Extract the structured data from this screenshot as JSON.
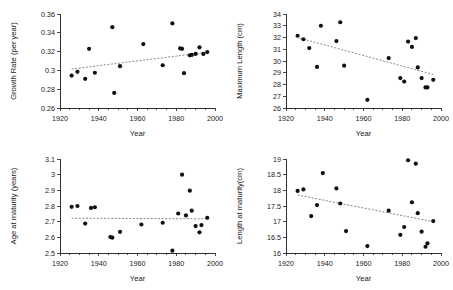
{
  "figure": {
    "title": "",
    "layout": "2x2 grid of scatter plots with dotted linear trend lines",
    "panel_count": 4
  },
  "chart_data": [
    {
      "id": "growth-rate",
      "type": "scatter",
      "title": "",
      "xlabel": "Year",
      "ylabel": "Growth Rate (per year)",
      "xlim": [
        1920,
        2000
      ],
      "ylim": [
        0.26,
        0.36
      ],
      "xticks": [
        1920,
        1940,
        1960,
        1980,
        2000
      ],
      "xtick_labels": [
        "1920",
        "1940",
        "1960",
        "1980",
        "2000"
      ],
      "yticks": [
        0.26,
        0.28,
        0.3,
        0.32,
        0.34,
        0.36
      ],
      "ytick_labels": [
        "0.26",
        "0.28",
        "0.3",
        "0.32",
        "0.34",
        "0.36"
      ],
      "minor_tick_step": 5,
      "grid": false,
      "legend": "none",
      "trend": {
        "style": "dotted",
        "x": [
          1926,
          1997
        ],
        "y": [
          0.3015,
          0.3195
        ],
        "slope_sign": "positive"
      },
      "points": [
        {
          "x": 1926,
          "y": 0.2945
        },
        {
          "x": 1929,
          "y": 0.2985
        },
        {
          "x": 1933,
          "y": 0.291
        },
        {
          "x": 1935,
          "y": 0.323
        },
        {
          "x": 1938,
          "y": 0.2975
        },
        {
          "x": 1947,
          "y": 0.346
        },
        {
          "x": 1948,
          "y": 0.276
        },
        {
          "x": 1951,
          "y": 0.3045
        },
        {
          "x": 1963,
          "y": 0.328
        },
        {
          "x": 1973,
          "y": 0.3055
        },
        {
          "x": 1978,
          "y": 0.35
        },
        {
          "x": 1982,
          "y": 0.3235
        },
        {
          "x": 1983,
          "y": 0.323
        },
        {
          "x": 1984,
          "y": 0.297
        },
        {
          "x": 1987,
          "y": 0.316
        },
        {
          "x": 1988,
          "y": 0.3165
        },
        {
          "x": 1990,
          "y": 0.3175
        },
        {
          "x": 1992,
          "y": 0.3245
        },
        {
          "x": 1994,
          "y": 0.3175
        },
        {
          "x": 1996,
          "y": 0.3195
        }
      ]
    },
    {
      "id": "maximum-length",
      "type": "scatter",
      "title": "",
      "xlabel": "Year",
      "ylabel": "Maximum Length (cm)",
      "xlim": [
        1920,
        2000
      ],
      "ylim": [
        26,
        34
      ],
      "xticks": [
        1920,
        1940,
        1960,
        1980,
        2000
      ],
      "xtick_labels": [
        "1920",
        "1940",
        "1960",
        "1980",
        "2000"
      ],
      "yticks": [
        26,
        27,
        28,
        29,
        30,
        31,
        32,
        33,
        34
      ],
      "ytick_labels": [
        "26",
        "27",
        "28",
        "29",
        "30",
        "31",
        "32",
        "33",
        "34"
      ],
      "minor_tick_step": 5,
      "grid": false,
      "legend": "none",
      "trend": {
        "style": "dotted",
        "x": [
          1927,
          1996
        ],
        "y": [
          31.95,
          28.85
        ],
        "slope_sign": "negative"
      },
      "points": [
        {
          "x": 1926,
          "y": 32.15
        },
        {
          "x": 1929,
          "y": 31.85
        },
        {
          "x": 1932,
          "y": 31.1
        },
        {
          "x": 1936,
          "y": 29.5
        },
        {
          "x": 1938,
          "y": 33.0
        },
        {
          "x": 1946,
          "y": 31.7
        },
        {
          "x": 1948,
          "y": 33.3
        },
        {
          "x": 1950,
          "y": 29.6
        },
        {
          "x": 1962,
          "y": 26.7
        },
        {
          "x": 1973,
          "y": 30.25
        },
        {
          "x": 1979,
          "y": 28.55
        },
        {
          "x": 1981,
          "y": 28.25
        },
        {
          "x": 1983,
          "y": 31.65
        },
        {
          "x": 1985,
          "y": 31.2
        },
        {
          "x": 1987,
          "y": 31.95
        },
        {
          "x": 1988,
          "y": 29.45
        },
        {
          "x": 1990,
          "y": 28.55
        },
        {
          "x": 1992,
          "y": 27.75
        },
        {
          "x": 1993,
          "y": 27.75
        },
        {
          "x": 1996,
          "y": 28.4
        }
      ]
    },
    {
      "id": "age-at-maturity",
      "type": "scatter",
      "title": "",
      "xlabel": "Year",
      "ylabel": "Age at maturity (years)",
      "xlim": [
        1920,
        2000
      ],
      "ylim": [
        2.5,
        3.1
      ],
      "xticks": [
        1920,
        1940,
        1960,
        1980,
        2000
      ],
      "xtick_labels": [
        "1920",
        "1940",
        "1960",
        "1980",
        "2000"
      ],
      "yticks": [
        2.5,
        2.6,
        2.7,
        2.8,
        2.9,
        3.0,
        3.1
      ],
      "ytick_labels": [
        "2.5",
        "2.6",
        "2.7",
        "2.8",
        "2.9",
        "3",
        "3.1"
      ],
      "minor_tick_step": 5,
      "grid": false,
      "legend": "none",
      "trend": {
        "style": "dotted",
        "x": [
          1926,
          1997
        ],
        "y": [
          2.722,
          2.718
        ],
        "slope_sign": "flat"
      },
      "points": [
        {
          "x": 1926,
          "y": 2.795
        },
        {
          "x": 1929,
          "y": 2.8
        },
        {
          "x": 1933,
          "y": 2.688
        },
        {
          "x": 1936,
          "y": 2.788
        },
        {
          "x": 1938,
          "y": 2.792
        },
        {
          "x": 1946,
          "y": 2.602
        },
        {
          "x": 1947,
          "y": 2.598
        },
        {
          "x": 1951,
          "y": 2.635
        },
        {
          "x": 1962,
          "y": 2.682
        },
        {
          "x": 1973,
          "y": 2.693
        },
        {
          "x": 1978,
          "y": 2.515
        },
        {
          "x": 1981,
          "y": 2.752
        },
        {
          "x": 1983,
          "y": 3.0
        },
        {
          "x": 1985,
          "y": 2.74
        },
        {
          "x": 1987,
          "y": 2.898
        },
        {
          "x": 1988,
          "y": 2.77
        },
        {
          "x": 1990,
          "y": 2.672
        },
        {
          "x": 1992,
          "y": 2.632
        },
        {
          "x": 1993,
          "y": 2.678
        },
        {
          "x": 1996,
          "y": 2.725
        }
      ]
    },
    {
      "id": "length-at-maturity",
      "type": "scatter",
      "title": "",
      "xlabel": "Year",
      "ylabel": "Length at maturity(cm)",
      "xlim": [
        1920,
        2000
      ],
      "ylim": [
        16,
        19
      ],
      "xticks": [
        1920,
        1940,
        1960,
        1980,
        2000
      ],
      "xtick_labels": [
        "1920",
        "1940",
        "1960",
        "1980",
        "2000"
      ],
      "yticks": [
        16,
        16.5,
        17,
        17.5,
        18,
        18.5,
        19
      ],
      "ytick_labels": [
        "16",
        "16.5",
        "17",
        "17.5",
        "18",
        "18.5",
        "19"
      ],
      "minor_tick_step": 5,
      "grid": false,
      "legend": "none",
      "trend": {
        "style": "dotted",
        "x": [
          1926,
          1996
        ],
        "y": [
          17.85,
          17.0
        ],
        "slope_sign": "negative"
      },
      "points": [
        {
          "x": 1926,
          "y": 17.98
        },
        {
          "x": 1929,
          "y": 18.03
        },
        {
          "x": 1933,
          "y": 17.18
        },
        {
          "x": 1936,
          "y": 17.53
        },
        {
          "x": 1939,
          "y": 18.55
        },
        {
          "x": 1946,
          "y": 18.06
        },
        {
          "x": 1948,
          "y": 17.58
        },
        {
          "x": 1951,
          "y": 16.7
        },
        {
          "x": 1962,
          "y": 16.22
        },
        {
          "x": 1973,
          "y": 17.35
        },
        {
          "x": 1979,
          "y": 16.58
        },
        {
          "x": 1981,
          "y": 16.83
        },
        {
          "x": 1983,
          "y": 18.96
        },
        {
          "x": 1985,
          "y": 17.62
        },
        {
          "x": 1987,
          "y": 18.85
        },
        {
          "x": 1988,
          "y": 17.27
        },
        {
          "x": 1990,
          "y": 16.68
        },
        {
          "x": 1992,
          "y": 16.2
        },
        {
          "x": 1993,
          "y": 16.31
        },
        {
          "x": 1996,
          "y": 17.02
        }
      ]
    }
  ]
}
